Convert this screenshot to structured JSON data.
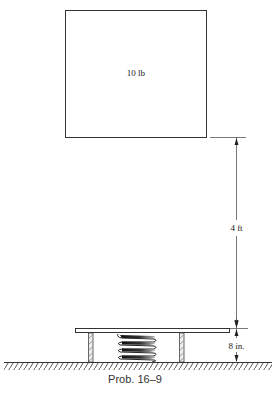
{
  "figure": {
    "block_label": "10 lb",
    "drop_height_label": "4 ft",
    "spring_height_label": "8 in.",
    "caption": "Prob. 16–9"
  },
  "colors": {
    "line": "#333333",
    "background": "#ffffff"
  }
}
